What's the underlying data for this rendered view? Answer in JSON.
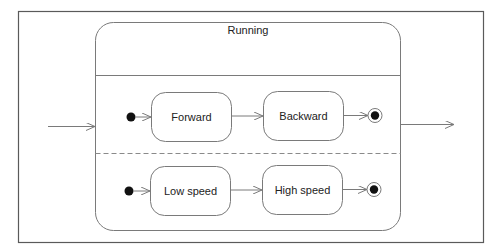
{
  "diagram": {
    "type": "UML state machine",
    "composite_state": {
      "name": "Running",
      "regions": [
        {
          "states": [
            "Forward",
            "Backward"
          ],
          "has_initial": true,
          "has_final": true
        },
        {
          "states": [
            "Low speed",
            "High speed"
          ],
          "has_initial": true,
          "has_final": true
        }
      ]
    },
    "labels": {
      "running": "Running",
      "forward": "Forward",
      "backward": "Backward",
      "low_speed": "Low speed",
      "high_speed": "High speed"
    },
    "colors": {
      "stroke": "#7a7a7a",
      "frame": "#5a5a5a",
      "dot": "#111111",
      "text": "#222222"
    }
  }
}
